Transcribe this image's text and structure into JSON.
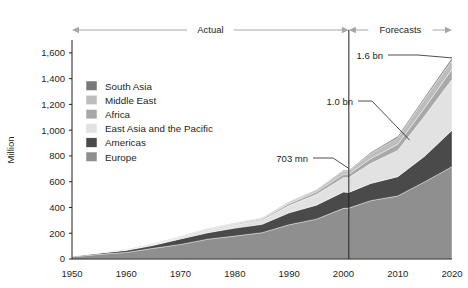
{
  "chart_data": {
    "type": "area",
    "title": "",
    "subtitle": "",
    "xlabel": "",
    "ylabel": "Million",
    "xlim": [
      1950,
      2020
    ],
    "ylim": [
      0,
      1700
    ],
    "grid": false,
    "legend_position": "inside-upper-left",
    "stacked": true,
    "x": [
      1950,
      1955,
      1960,
      1965,
      1970,
      1975,
      1980,
      1985,
      1990,
      1995,
      2000,
      2001,
      2005,
      2010,
      2015,
      2020
    ],
    "xticks": [
      "1950",
      "1960",
      "1970",
      "1980",
      "1990",
      "2000",
      "2010",
      "2020"
    ],
    "xtick_values": [
      1950,
      1960,
      1970,
      1980,
      1990,
      2000,
      2010,
      2020
    ],
    "yticks": [
      "0",
      "200",
      "400",
      "600",
      "800",
      "1,000",
      "1,200",
      "1,400",
      "1,600"
    ],
    "ytick_values": [
      0,
      200,
      400,
      600,
      800,
      1000,
      1200,
      1400,
      1600
    ],
    "series": [
      {
        "name": "Europe",
        "color": "#8f8f8f",
        "values": [
          17,
          36,
          51,
          83,
          113,
          154,
          178,
          204,
          266,
          309,
          393,
          395,
          453,
          489,
          600,
          717
        ]
      },
      {
        "name": "Americas",
        "color": "#4a4a4a",
        "values": [
          7,
          10,
          16,
          23,
          43,
          50,
          62,
          65,
          93,
          109,
          128,
          122,
          133,
          150,
          199,
          282
        ]
      },
      {
        "name": "East Asia and the Pacific",
        "color": "#e2e2e2",
        "values": [
          0,
          1,
          3,
          6,
          11,
          19,
          23,
          31,
          56,
          82,
          110,
          115,
          156,
          204,
          313,
          397
        ]
      },
      {
        "name": "Africa",
        "color": "#a8a8a8",
        "values": [
          1,
          1,
          1,
          3,
          5,
          7,
          7,
          10,
          15,
          20,
          27,
          28,
          37,
          47,
          64,
          77
        ]
      },
      {
        "name": "Middle East",
        "color": "#bdbdbd",
        "values": [
          0,
          1,
          1,
          2,
          3,
          4,
          7,
          8,
          10,
          14,
          25,
          23,
          38,
          50,
          69,
          69
        ]
      },
      {
        "name": "South Asia",
        "color": "#787878",
        "values": [
          0,
          0,
          1,
          1,
          1,
          2,
          2,
          3,
          4,
          4,
          6,
          6,
          9,
          12,
          15,
          19
        ]
      }
    ],
    "annotations": [
      {
        "id": "total-2001",
        "label": "703 mn",
        "x": 2001,
        "y": 703
      },
      {
        "id": "total-2010",
        "label": "1.0 bn",
        "x": 2010,
        "y": 1000
      },
      {
        "id": "total-2020",
        "label": "1.6 bn",
        "x": 2020,
        "y": 1600
      }
    ],
    "spans": [
      {
        "id": "actual",
        "label": "Actual",
        "from": 1950,
        "to": 2001
      },
      {
        "id": "forecasts",
        "label": "Forecasts",
        "from": 2001,
        "to": 2020
      }
    ],
    "divider_x": 2001
  },
  "legend": {
    "items": [
      {
        "label": "South Asia",
        "color": "#787878"
      },
      {
        "label": "Middle East",
        "color": "#bdbdbd"
      },
      {
        "label": "Africa",
        "color": "#a8a8a8"
      },
      {
        "label": "East Asia and the Pacific",
        "color": "#e2e2e2"
      },
      {
        "label": "Americas",
        "color": "#4a4a4a"
      },
      {
        "label": "Europe",
        "color": "#8f8f8f"
      }
    ]
  },
  "axes": {
    "y_title": "Million"
  }
}
